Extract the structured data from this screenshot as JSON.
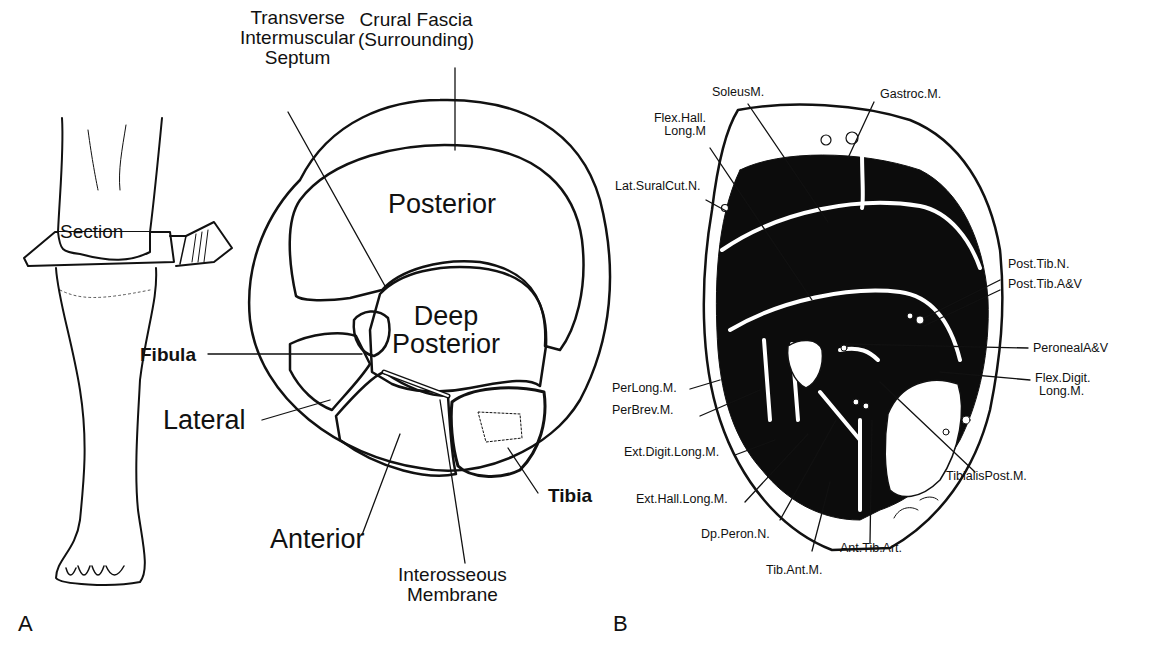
{
  "figure": {
    "panel_a": {
      "letter": "A",
      "leg_label": "Section",
      "compartments": {
        "posterior": "Posterior",
        "deep_line1": "Deep",
        "deep_line2": "Posterior",
        "lateral": "Lateral",
        "anterior": "Anterior"
      },
      "callouts": {
        "septum_l1": "Transverse",
        "septum_l2": "Intermuscular",
        "septum_l3": "Septum",
        "fascia_l1": "Crural Fascia",
        "fascia_l2": "(Surrounding)",
        "fibula": "Fibula",
        "tibia": "Tibia",
        "membrane_l1": "Interosseous",
        "membrane_l2": "Membrane"
      }
    },
    "panel_b": {
      "letter": "B",
      "labels": {
        "soleus": "SoleusM.",
        "gastroc": "Gastroc.M.",
        "fhl_l1": "Flex.Hall.",
        "fhl_l2": "Long.M",
        "lat_sural": "Lat.SuralCut.N.",
        "post_tib_n": "Post.Tib.N.",
        "post_tib_av": "Post.Tib.A&V",
        "peroneal_av": "PeronealA&V",
        "fdl_l1": "Flex.Digit.",
        "fdl_l2": "Long.M.",
        "per_long": "PerLong.M.",
        "per_brev": "PerBrev.M.",
        "ext_digit": "Ext.Digit.Long.M.",
        "ext_hall": "Ext.Hall.Long.M.",
        "dp_peron": "Dp.Peron.N.",
        "tib_ant": "Tib.Ant.M.",
        "ant_tib_art": "Ant.Tib.Art.",
        "tib_post": "TibialisPost.M."
      }
    },
    "colors": {
      "ink": "#111111",
      "paper": "#ffffff"
    }
  }
}
